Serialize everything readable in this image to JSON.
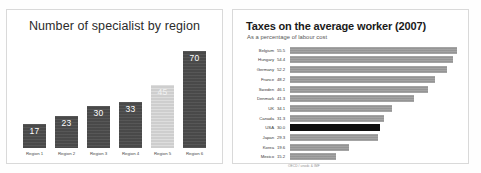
{
  "left_panel": {
    "title": "Number of specialist by region"
  },
  "right_panel": {
    "title": "Taxes on the average worker (2007)",
    "subtitle": "As a percentage of labour cost",
    "footnote": "OECD / unodc & IMF"
  },
  "chart_data": [
    {
      "type": "bar",
      "title": "Number of specialist by region",
      "xlabel": "",
      "ylabel": "",
      "ylim": [
        0,
        75
      ],
      "grid": false,
      "legend": "none",
      "orientation": "vertical",
      "categories": [
        "Region 1",
        "Region 2",
        "Region 3",
        "Region 4",
        "Region 5",
        "Region 6"
      ],
      "values": [
        17,
        23,
        30,
        33,
        45,
        70
      ],
      "data_labels": [
        "17",
        "23",
        "30",
        "33",
        "45",
        "70"
      ],
      "highlight_index": 4,
      "colors": {
        "bar": "#4d4d4d",
        "highlight": "#d2d2d2",
        "label_text": "#ffffff",
        "panel_background": "#ffffff",
        "panel_border": "#d9d9d9"
      }
    },
    {
      "type": "bar",
      "title": "Taxes on the average worker (2007)",
      "subtitle": "As a percentage of labour cost",
      "xlabel": "",
      "ylabel": "",
      "xlim": [
        0,
        56
      ],
      "grid": false,
      "legend": "none",
      "orientation": "horizontal",
      "categories": [
        "Belgium",
        "Hungary",
        "Germany",
        "France",
        "Sweden",
        "Denmark",
        "UK",
        "Canada",
        "USA",
        "Japan",
        "Korea",
        "Mexico"
      ],
      "values": [
        55.5,
        54.4,
        52.2,
        48.2,
        46.1,
        41.3,
        34.1,
        31.3,
        30.0,
        29.3,
        19.6,
        15.2
      ],
      "data_labels": [
        "55.5",
        "54.4",
        "52.2",
        "48.2",
        "46.1",
        "41.3",
        "34.1",
        "31.3",
        "30.0",
        "29.3",
        "19.6",
        "15.2"
      ],
      "highlight_index": 8,
      "colors": {
        "bar": "#9a9a9a",
        "highlight": "#0d0d0d",
        "label_text": "#3a3a3a",
        "panel_background": "#ffffff",
        "panel_border": "#d9d9d9"
      }
    }
  ]
}
